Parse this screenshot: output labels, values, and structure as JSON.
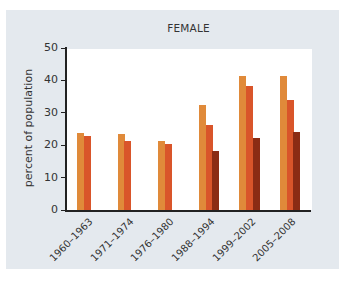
{
  "chart_data": {
    "type": "bar",
    "title": "FEMALE",
    "xlabel": "",
    "ylabel": "percent of population",
    "ylim": [
      0,
      50
    ],
    "yticks": [
      0,
      10,
      20,
      30,
      40,
      50
    ],
    "grid": false,
    "legend": null,
    "categories": [
      "1960–1963",
      "1971–1974",
      "1976–1980",
      "1988–1994",
      "1999–2002",
      "2005–2008"
    ],
    "series": [
      {
        "name": "Series 1",
        "color": "#e08a3a",
        "values": [
          23.8,
          23.6,
          21.3,
          32.3,
          41.3,
          41.3
        ]
      },
      {
        "name": "Series 2",
        "color": "#d9552a",
        "values": [
          22.9,
          21.3,
          20.3,
          26.2,
          38.2,
          34.1
        ]
      },
      {
        "name": "Series 3",
        "color": "#8b2c14",
        "values": [
          null,
          null,
          null,
          18.2,
          22.2,
          24.1
        ]
      }
    ]
  },
  "labels": {
    "title": "FEMALE",
    "ylabel": "percent of population",
    "yticks": [
      "0",
      "10",
      "20",
      "30",
      "40",
      "50"
    ],
    "categories": [
      "1960–1963",
      "1971–1974",
      "1976–1980",
      "1988–1994",
      "1999–2002",
      "2005–2008"
    ]
  }
}
